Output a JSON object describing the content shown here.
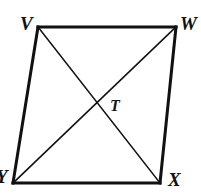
{
  "figure": {
    "kind": "geometry-diagram",
    "shape_name": "quadrilateral-VWXY",
    "background_color": "#ffffff",
    "stroke_color": "#111111",
    "side_stroke_width": 3,
    "diagonal_stroke_width": 1.6,
    "vertices": [
      {
        "id": "V",
        "label": "V",
        "x": 38,
        "y": 27,
        "position": "top-left"
      },
      {
        "id": "W",
        "label": "W",
        "x": 176,
        "y": 27,
        "position": "top-right"
      },
      {
        "id": "X",
        "label": "X",
        "x": 160,
        "y": 183,
        "position": "bottom-right"
      },
      {
        "id": "Y",
        "label": "Y",
        "x": 13,
        "y": 183,
        "position": "bottom-left"
      }
    ],
    "sides": [
      {
        "name": "side-VW",
        "from": "V",
        "to": "W"
      },
      {
        "name": "side-WX",
        "from": "W",
        "to": "X"
      },
      {
        "name": "side-XY",
        "from": "X",
        "to": "Y"
      },
      {
        "name": "side-YV",
        "from": "Y",
        "to": "V"
      }
    ],
    "diagonals": [
      {
        "name": "diagonal-VX",
        "from": "V",
        "to": "X"
      },
      {
        "name": "diagonal-WY",
        "from": "W",
        "to": "Y"
      }
    ],
    "intersection": {
      "id": "T",
      "label": "T",
      "x": 96,
      "y": 105,
      "description": "intersection of diagonals"
    }
  }
}
